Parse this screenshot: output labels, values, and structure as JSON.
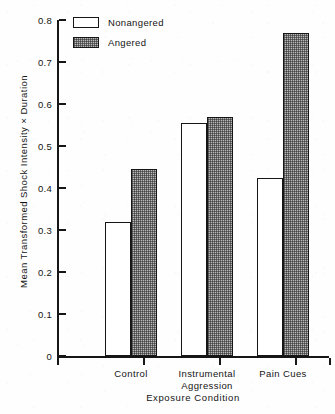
{
  "chart_data": {
    "type": "bar",
    "title": "",
    "subtitle": "",
    "xlabel": "Exposure Condition",
    "ylabel": "Mean Transformed Shock Intensity × Duration",
    "categories": [
      "Control",
      "Instrumental Aggression",
      "Pain Cues"
    ],
    "category_lines": [
      [
        "Control"
      ],
      [
        "Instrumental",
        "Aggression"
      ],
      [
        "Pain Cues"
      ]
    ],
    "series": [
      {
        "name": "Nonangered",
        "fill": "open",
        "values": [
          0.32,
          0.555,
          0.425
        ]
      },
      {
        "name": "Angered",
        "fill": "stippled-gray",
        "values": [
          0.445,
          0.57,
          0.77
        ]
      }
    ],
    "ylim": [
      0,
      0.8
    ],
    "ytick_values": [
      0,
      0.1,
      0.2,
      0.3,
      0.4,
      0.5,
      0.6,
      0.7,
      0.8
    ],
    "ytick_labels": [
      "0",
      "0.1",
      "0.2",
      "0.3",
      "0.4",
      "0.5",
      "0.6",
      "0.7",
      "0.8"
    ],
    "grid": false,
    "legend_position": "top-left",
    "legend_entries": [
      "Nonangered",
      "Angered"
    ],
    "colors": {
      "axis": "#161616",
      "bar_outline": "#161616",
      "nonangered_fill": "#ffffff",
      "angered_fill": "#b9b9b9",
      "background": "#fefefe",
      "text": "#141414"
    }
  },
  "legend": {
    "items": [
      {
        "label": "Nonangered",
        "style": "open"
      },
      {
        "label": "Angered",
        "style": "filled"
      }
    ]
  },
  "axes": {
    "y_title": "Mean Transformed Shock Intensity × Duration",
    "x_title": "Exposure Condition"
  }
}
